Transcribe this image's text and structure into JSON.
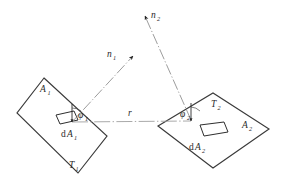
{
  "figure": {
    "background_color": "#ffffff",
    "line_color": "#3a3a3a",
    "ray_color": "#8a8a8a",
    "width": 283,
    "height": 185
  },
  "labels": {
    "surface1_area": {
      "base": "A",
      "sub": "1"
    },
    "surface1_temp": {
      "base": "T",
      "sub": "1"
    },
    "surface2_area": {
      "base": "A",
      "sub": "2"
    },
    "surface2_temp": {
      "base": "T",
      "sub": "2"
    },
    "element1": {
      "prefix": "d",
      "base": "A",
      "sub": "1"
    },
    "element2": {
      "prefix": "d",
      "base": "A",
      "sub": "2"
    },
    "normal1": {
      "base": "n",
      "sub": "1"
    },
    "normal2": {
      "base": "n",
      "sub": "2"
    },
    "angle1": {
      "base": "φ",
      "sub": "1"
    },
    "angle2": {
      "base": "φ",
      "sub": "2"
    },
    "distance": {
      "base": "r",
      "sub": ""
    }
  },
  "geometry": {
    "surface1_polygon": "44,78 107,136 78,173 17,113",
    "surface2_polygon": "158,126 213,93 269,129 213,168",
    "element1_polygon": "56,115 74,111 78,120 60,124",
    "element2_polygon": "200,125 224,122 228,132 204,136",
    "ray1_path": "M 72,122 L 133,56",
    "ray2_path": "M 191,120 L 145,16",
    "connector_path": "M 72,122 L 191,121",
    "normal1_stub": "M 72,122 L 72,104",
    "normal2_stub": "M 191,121 L 191,103",
    "arc1_path": "M 72,108 A 14 14 0 0 1 81,111",
    "arc2_path": "M 191,107 A 14 14 0 0 1 200,111"
  },
  "icons": {
    "arrowhead_normal1": "normal-arrow-icon",
    "arrowhead_normal2": "normal-arrow-icon",
    "arrowhead_ray1": "ray-arrow-icon",
    "arrowhead_ray2": "ray-arrow-icon"
  }
}
